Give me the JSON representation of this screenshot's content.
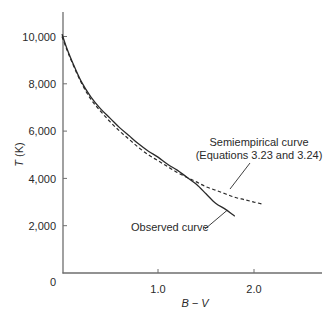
{
  "chart_data": {
    "type": "line",
    "title": "",
    "xlabel": "B − V",
    "ylabel": "T (K)",
    "ylabel_italic_part": "T",
    "ylabel_unit_part": " (K)",
    "xlim": [
      0,
      2.7
    ],
    "ylim": [
      0,
      11000
    ],
    "x_ticks": [
      0,
      1.0,
      2.0
    ],
    "x_tick_labels": [
      "0",
      "1.0",
      "2.0"
    ],
    "y_ticks": [
      2000,
      4000,
      6000,
      8000,
      10000
    ],
    "y_tick_labels": [
      "2,000",
      "4,000",
      "6,000",
      "8,000",
      "10,000"
    ],
    "origin_label": "0",
    "grid": false,
    "legend": null,
    "series": [
      {
        "name": "Observed curve",
        "style": "solid",
        "x": [
          0.0,
          0.05,
          0.1,
          0.2,
          0.3,
          0.4,
          0.5,
          0.6,
          0.7,
          0.8,
          0.9,
          1.0,
          1.1,
          1.2,
          1.3,
          1.4,
          1.5,
          1.6,
          1.7,
          1.8
        ],
        "y": [
          10100,
          9500,
          9000,
          8100,
          7450,
          6950,
          6550,
          6150,
          5800,
          5450,
          5150,
          4900,
          4600,
          4350,
          4050,
          3750,
          3350,
          2950,
          2700,
          2400
        ]
      },
      {
        "name": "Semiempirical curve (Equations 3.23 and 3.24)",
        "style": "dashed",
        "x": [
          0.0,
          0.05,
          0.1,
          0.2,
          0.3,
          0.4,
          0.5,
          0.6,
          0.7,
          0.8,
          0.9,
          1.0,
          1.1,
          1.2,
          1.3,
          1.4,
          1.5,
          1.6,
          1.7,
          1.8,
          1.9,
          2.0,
          2.1
        ],
        "y": [
          10000,
          9450,
          8950,
          8050,
          7350,
          6850,
          6400,
          6000,
          5650,
          5300,
          5000,
          4750,
          4500,
          4250,
          4050,
          3850,
          3650,
          3500,
          3350,
          3200,
          3100,
          3000,
          2900
        ]
      }
    ],
    "annotations": [
      {
        "text_lines": [
          "Semiempirical curve",
          "(Equations 3.23 and 3.24)"
        ],
        "points_to": {
          "x": 1.75,
          "y": 3550
        }
      },
      {
        "text_lines": [
          "Observed curve"
        ],
        "points_to": {
          "x": 1.72,
          "y": 2650
        }
      }
    ]
  },
  "colors": {
    "axis": "#6e6e6e",
    "curve": "#2a2a2a",
    "text": "#2a2a2a"
  }
}
